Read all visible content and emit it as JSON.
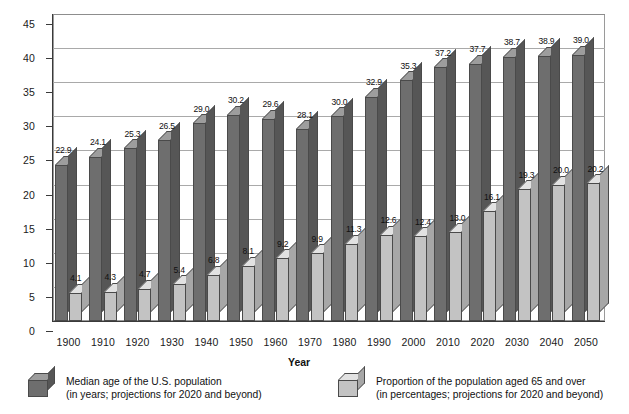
{
  "chart_data": {
    "type": "bar",
    "title": "",
    "xlabel": "Year",
    "ylabel": "",
    "ylim": [
      0,
      45
    ],
    "yticks": [
      0,
      5,
      10,
      15,
      20,
      25,
      30,
      35,
      40,
      45
    ],
    "grid": true,
    "legend_position": "bottom",
    "categories": [
      "1900",
      "1910",
      "1920",
      "1930",
      "1940",
      "1950",
      "1960",
      "1970",
      "1980",
      "1990",
      "2000",
      "2010",
      "2020",
      "2030",
      "2040",
      "2050"
    ],
    "series": [
      {
        "name": "Median age of the U.S. population",
        "color": "#6e6e6e",
        "values": [
          22.9,
          24.1,
          25.3,
          26.5,
          29.0,
          30.2,
          29.6,
          28.1,
          30.0,
          32.9,
          35.3,
          37.2,
          37.7,
          38.7,
          38.9,
          39.0
        ],
        "labels": [
          "22.9",
          "24.1",
          "25.3",
          "26.5",
          "29.0",
          "30.2",
          "29.6",
          "28.1",
          "30.0",
          "32.9",
          "35.3",
          "37.2",
          "37.7",
          "38.7",
          "38.9",
          "39.0"
        ]
      },
      {
        "name": "Proportion of the population aged 65 and over",
        "color": "#c3c3c3",
        "values": [
          4.1,
          4.3,
          4.7,
          5.4,
          6.8,
          8.1,
          9.2,
          9.9,
          11.3,
          12.6,
          12.4,
          13.0,
          16.1,
          19.3,
          20.0,
          20.2
        ],
        "labels": [
          "4.1",
          "4.3",
          "4.7",
          "5.4",
          "6.8",
          "8.1",
          "9.2",
          "9.9",
          "11.3",
          "12.6",
          "12.4",
          "13.0",
          "16.1",
          "19.3",
          "20.0",
          "20.2"
        ]
      }
    ]
  },
  "legend": [
    {
      "line1": "Median age of the U.S. population",
      "line2": "(in years; projections for 2020 and beyond)",
      "swatch": "dark-gray-cube"
    },
    {
      "line1": "Proportion of the population aged 65 and over",
      "line2": "(in percentages; projections for 2020 and beyond)",
      "swatch": "light-gray-cube"
    }
  ]
}
